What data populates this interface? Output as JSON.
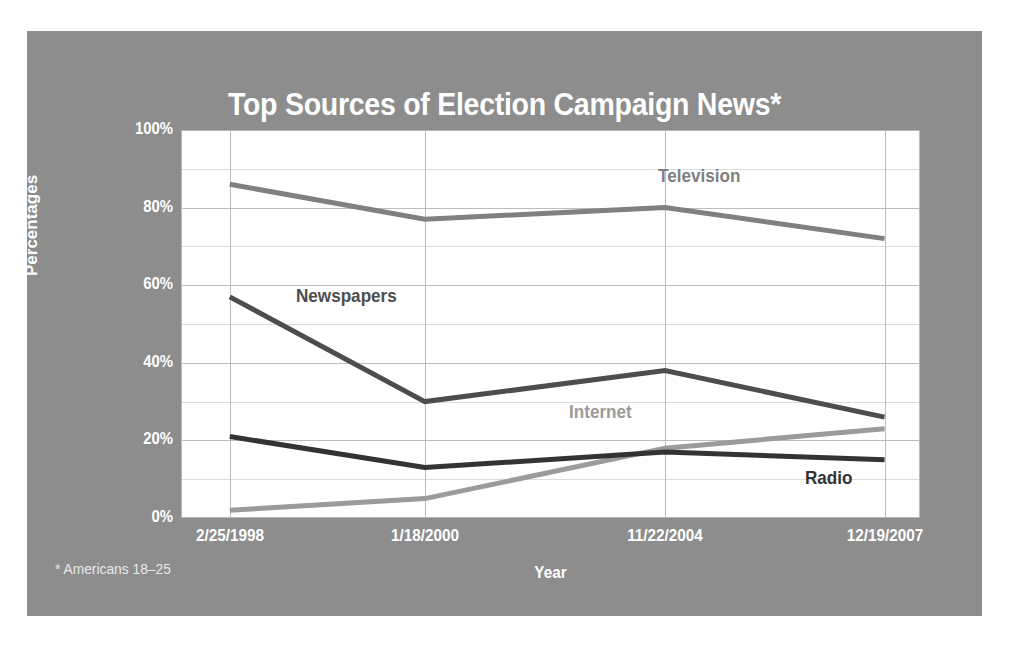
{
  "figure": {
    "panel_color": "#8d8d8d",
    "page_background": "#ffffff",
    "plot_background": "#ffffff"
  },
  "footnote": "* Americans 18–25",
  "chart_data": {
    "type": "line",
    "title": "Top Sources of Election Campaign News*",
    "xlabel": "Year",
    "ylabel": "Percentages",
    "categories": [
      "2/25/1998",
      "1/18/2000",
      "11/22/2004",
      "12/19/2007"
    ],
    "x_tick_labels": [
      "2/25/1998",
      "1/18/2000",
      "11/22/2004",
      "12/19/2007"
    ],
    "y_tick_labels": [
      "0%",
      "20%",
      "40%",
      "60%",
      "80%",
      "100%"
    ],
    "y_tick_values": [
      0,
      20,
      40,
      60,
      80,
      100
    ],
    "ylim": [
      0,
      100
    ],
    "minor_gridline_interval": 10,
    "grid": true,
    "legend": "inline-labels",
    "series": [
      {
        "name": "Television",
        "color": "#808080",
        "values": [
          86,
          77,
          80,
          72
        ],
        "label_x_frac": 0.645,
        "label_y_pct": 88
      },
      {
        "name": "Newspapers",
        "color": "#4d4d4d",
        "values": [
          57,
          30,
          38,
          26
        ],
        "label_x_frac": 0.155,
        "label_y_pct": 57
      },
      {
        "name": "Internet",
        "color": "#9b9b9b",
        "values": [
          2,
          5,
          18,
          23
        ],
        "label_x_frac": 0.525,
        "label_y_pct": 27
      },
      {
        "name": "Radio",
        "color": "#333333",
        "values": [
          21,
          13,
          17,
          15
        ],
        "label_x_frac": 0.845,
        "label_y_pct": 10
      }
    ]
  }
}
